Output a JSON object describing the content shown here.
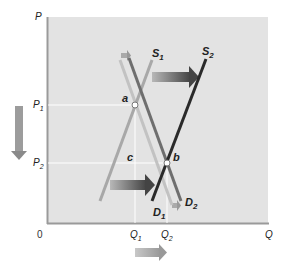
{
  "diagram": {
    "type": "supply-demand-shift",
    "axes": {
      "y_label": "P",
      "x_label": "Q",
      "origin_label": "0",
      "y_ticks": [
        {
          "label": "P",
          "sub": "1",
          "y": 105
        },
        {
          "label": "P",
          "sub": "2",
          "y": 163
        }
      ],
      "x_ticks": [
        {
          "label": "Q",
          "sub": "1",
          "x": 135
        },
        {
          "label": "Q",
          "sub": "2",
          "x": 167
        }
      ]
    },
    "curves": {
      "S1": {
        "label": "S",
        "sub": "1",
        "color": "#a8a8a8"
      },
      "S2": {
        "label": "S",
        "sub": "2",
        "color": "#2a2a2a"
      },
      "D1": {
        "label": "D",
        "sub": "1",
        "color": "#c2c2c2"
      },
      "D2": {
        "label": "D",
        "sub": "2",
        "color": "#6e6e6e"
      }
    },
    "points": {
      "a": {
        "label": "a"
      },
      "b": {
        "label": "b"
      },
      "c": {
        "label": "c"
      }
    },
    "arrows": {
      "supply_shift": "right",
      "demand_shift": "right",
      "price_change": "down",
      "quantity_change": "right"
    },
    "colors": {
      "plot_bg": "#e3e3e3",
      "axis": "#9a9a9a",
      "guide": "#ffffff",
      "arrow_dark": "#4a4a4a",
      "arrow_light": "#9c9c9c"
    }
  }
}
